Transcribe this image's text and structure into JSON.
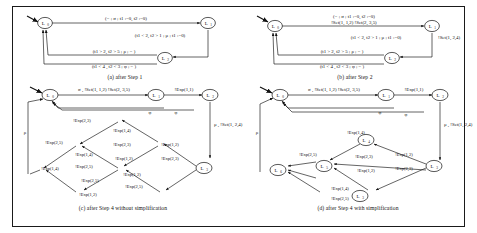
{
  "figure": {
    "panels": [
      {
        "id": "a",
        "caption": "(a) after Step 1",
        "states": [
          {
            "name": "L0",
            "base": "L",
            "sub": "0"
          },
          {
            "name": "L1",
            "base": "L",
            "sub": "1"
          },
          {
            "name": "L2",
            "base": "L",
            "sub": "2"
          }
        ],
        "edges": [
          {
            "label": "(− ; σ ; t1 :=0, t2 :=0)"
          },
          {
            "label": "(t1 < 2, t2 > 1 ; μ   ; t1 :=0)"
          },
          {
            "label": "(t1 > 2, t2 > 5 ; ρ    ; − )"
          },
          {
            "label": "(t1 < 4 , t2 < 3 ; φ   ; − )"
          }
        ]
      },
      {
        "id": "b",
        "caption": "(b) after Step 2",
        "states": [
          {
            "name": "L0",
            "base": "L",
            "sub": "0"
          },
          {
            "name": "L1",
            "base": "L",
            "sub": "1"
          },
          {
            "name": "L2",
            "base": "L",
            "sub": "2"
          }
        ],
        "edges": [
          {
            "label": "(− ; σ ; t1 :=0, t2 :=0)"
          },
          {
            "label": "!Set(1, 1,2) !Set(2, 3,5)"
          },
          {
            "label": "(t1 < 2, t2 > 1 ; μ   ; t1 :=0)"
          },
          {
            "label": "!Set(1, 2,4)"
          },
          {
            "label": "(t1 > 2, t2 > 5 ; ρ    ; − )"
          },
          {
            "label": "(t1 < 4 , t2 < 3 ; φ   ; − )"
          }
        ]
      },
      {
        "id": "c",
        "caption": "(c) after Step 4 without simplification",
        "states": [
          {
            "name": "L0",
            "base": "L",
            "sub": "0"
          },
          {
            "name": "L1",
            "base": "L",
            "sub": "1"
          },
          {
            "name": "L2",
            "base": "L",
            "sub": "2"
          },
          {
            "name": "L3",
            "base": "L",
            "sub": "3"
          },
          {
            "name": "L4",
            "base": "L",
            "sub": "4"
          },
          {
            "name": "L5",
            "base": "L",
            "sub": "5"
          },
          {
            "name": "L6",
            "base": "L",
            "sub": "6"
          }
        ],
        "edges": [
          {
            "label": "σ , !Set(1, 1,2) !Set(2, 3,5)"
          },
          {
            "label": "!Exp(1,1)"
          },
          {
            "label": "μ , !Set(1, 2,4)"
          },
          {
            "label": "ρ"
          },
          {
            "label": "φ"
          },
          {
            "label": "φ"
          },
          {
            "label": "!Exp(2,3)"
          },
          {
            "label": "!Exp(1,4)"
          },
          {
            "label": "!Exp(2,5)"
          },
          {
            "label": "!Exp(2,3)"
          },
          {
            "label": "!Exp(1,2)"
          },
          {
            "label": "!Exp(1,4)"
          },
          {
            "label": "!Exp(2,5)"
          },
          {
            "label": "!Exp(1,2)"
          },
          {
            "label": "!Exp(2,3)"
          },
          {
            "label": "!Exp(1,4)"
          },
          {
            "label": "!Exp(2,5)"
          },
          {
            "label": "!Exp(1,2)"
          },
          {
            "label": "!Exp(2,5)"
          },
          {
            "label": "!Exp(1,2)"
          }
        ]
      },
      {
        "id": "d",
        "caption": "(d) after Step 4 with simplification",
        "states": [
          {
            "name": "L0",
            "base": "L",
            "sub": "0"
          },
          {
            "name": "L1",
            "base": "L",
            "sub": "1"
          },
          {
            "name": "L2",
            "base": "L",
            "sub": "2"
          },
          {
            "name": "L3",
            "base": "L",
            "sub": "3"
          },
          {
            "name": "L4",
            "base": "L",
            "sub": "4"
          },
          {
            "name": "L5",
            "base": "L",
            "sub": "5"
          },
          {
            "name": "L6",
            "base": "L",
            "sub": "6"
          }
        ],
        "edges": [
          {
            "label": "σ , !Set(1, 1,2) !Set(2, 3,5)"
          },
          {
            "label": "!Exp(1,1)"
          },
          {
            "label": "μ , !Set(1, 2,4)"
          },
          {
            "label": "ρ"
          },
          {
            "label": "φ"
          },
          {
            "label": "φ"
          },
          {
            "label": "!Exp(1,4)"
          },
          {
            "label": "!Exp(2,5)"
          },
          {
            "label": "!Exp(2,3)"
          },
          {
            "label": "!Exp(1,2)"
          },
          {
            "label": "!Exp(1,2)"
          },
          {
            "label": "!Exp(2,3)"
          },
          {
            "label": "!Exp(1,4)"
          },
          {
            "label": "!Exp(2,5)"
          }
        ]
      }
    ]
  }
}
